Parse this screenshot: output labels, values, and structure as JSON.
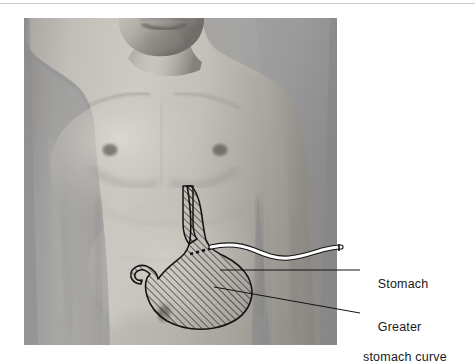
{
  "figure": {
    "kind": "anatomical-illustration",
    "background_color": "#ffffff",
    "top_rule_color": "#c9c9c9"
  },
  "photo": {
    "subject": "male-torso-front-view",
    "tone": "grayscale",
    "frame": {
      "x": 24,
      "y": 18,
      "width": 313,
      "height": 327
    },
    "background_color": "#9a9a9a",
    "skin_color": "#b4b1ac"
  },
  "overlay": {
    "stomach": {
      "name": "stomach-outline",
      "fill_pattern": "diagonal-hatch",
      "hatch_color": "#2b2b2b",
      "outline_color": "#141414"
    },
    "tube": {
      "name": "nasogastric-tube",
      "fill_color": "#ffffff",
      "outline_color": "#141414",
      "inner_segment_style": "dashed"
    },
    "leader_lines": {
      "color": "#141414",
      "width": 1
    }
  },
  "labels": [
    {
      "id": "stomach",
      "text": "Stomach",
      "line2": "",
      "x": 363,
      "y": 262
    },
    {
      "id": "greater-stomach-curve",
      "text": "Greater",
      "line2": "stomach curve",
      "x": 363,
      "y": 305
    }
  ]
}
